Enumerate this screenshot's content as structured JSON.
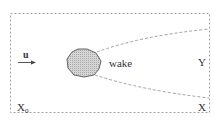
{
  "diagram": {
    "labels": {
      "velocity": "u",
      "wake": "wake",
      "outlet_line": "Y",
      "outlet_boundary": "X",
      "inlet_boundary_base": "X",
      "inlet_boundary_sub": "0"
    },
    "colors": {
      "border": "#9a9a9a",
      "wake_lines": "#8a8a8a",
      "body_fill": "#c8c8c8",
      "body_stroke": "#555555",
      "text": "#333333",
      "arrow": "#444444"
    },
    "elements": [
      {
        "type": "domain-boundary",
        "style": "dashed-rectangle"
      },
      {
        "type": "velocity-arrow",
        "label": "u",
        "direction": "right"
      },
      {
        "type": "body",
        "shape": "irregular-polygon",
        "fill": "hatched-grey"
      },
      {
        "type": "wake-boundary",
        "count": 2,
        "style": "dashed"
      },
      {
        "type": "label",
        "text": "wake"
      },
      {
        "type": "label",
        "text": "Y"
      },
      {
        "type": "label",
        "text": "X"
      },
      {
        "type": "label",
        "text": "X0"
      }
    ]
  }
}
